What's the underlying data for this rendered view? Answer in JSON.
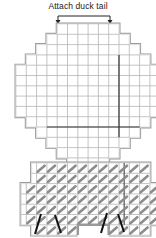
{
  "diagram": {
    "annotation": "Attach duck tail",
    "colors": {
      "grid_line": "#b5b5b5",
      "outline": "#9a9a9a",
      "outline_inner": "#e2e2e2",
      "marker_line": "#333333",
      "stitch": "#8c8c8c",
      "straight_stitch": "#111111"
    },
    "cell": 10.3,
    "origin_x": 16,
    "top_piece": {
      "origin_y": 24,
      "rows": [
        [
          4,
          10
        ],
        [
          3,
          11
        ],
        [
          2,
          12
        ],
        [
          1,
          13
        ],
        [
          0,
          14
        ],
        [
          0,
          14
        ],
        [
          0,
          14
        ],
        [
          0,
          14
        ],
        [
          0,
          14
        ],
        [
          1,
          13
        ],
        [
          2,
          12
        ],
        [
          3,
          11
        ],
        [
          4,
          10
        ],
        [
          5,
          9
        ],
        [
          5,
          9
        ]
      ],
      "marker_col": 10,
      "marker_col_rows": [
        3,
        11
      ],
      "marker_row": 10,
      "marker_row_cols": [
        3,
        12
      ]
    },
    "bottom_piece": {
      "origin_y": 163,
      "rows": [
        [
          1.5,
          13
        ],
        [
          1.5,
          13
        ],
        [
          0.5,
          14
        ],
        [
          0.5,
          14
        ],
        [
          0.5,
          14
        ],
        [
          0.5,
          14
        ],
        [
          1.5,
          13
        ]
      ],
      "notch": [
        6,
        9
      ],
      "marker_col": 10.5
    },
    "straight_stitches": [
      {
        "x1": 41,
        "y1": 214,
        "x2": 35,
        "y2": 234
      },
      {
        "x1": 55,
        "y1": 215,
        "x2": 61,
        "y2": 233
      },
      {
        "x1": 107,
        "y1": 213,
        "x2": 101,
        "y2": 233
      },
      {
        "x1": 118,
        "y1": 214,
        "x2": 124,
        "y2": 232
      }
    ]
  }
}
